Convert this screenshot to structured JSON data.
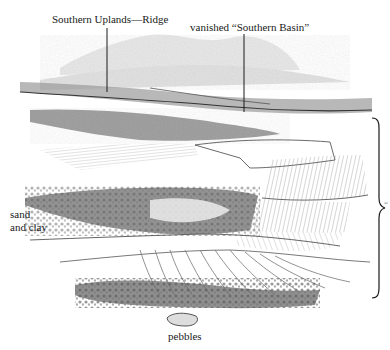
{
  "figure": {
    "labels": {
      "ridge": "Southern Uplands—Ridge",
      "basin": "vanished “Southern Basin”",
      "sand_clay_line1": "sand",
      "sand_clay_line2": "and clay",
      "pebbles": "pebbles",
      "right_cutoff": "“"
    },
    "brace": {
      "side": "right",
      "top": 118,
      "bottom": 298
    },
    "colors": {
      "ink": "#1a1a1a",
      "pencil": "#6b6b6b",
      "light_pencil": "#b5b5b5",
      "paper": "#ffffff"
    }
  }
}
